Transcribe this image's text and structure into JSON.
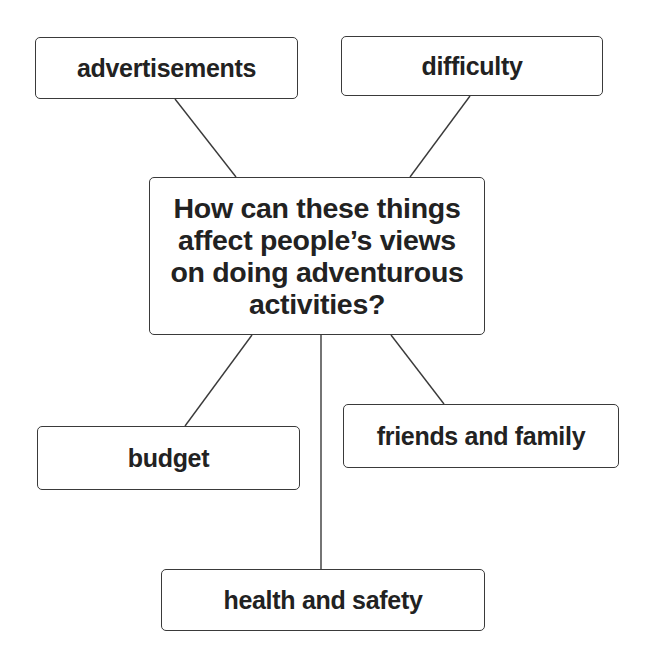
{
  "diagram": {
    "type": "mind-map",
    "center": {
      "lines": [
        "How can these things",
        "affect people’s views",
        "on doing adventurous",
        "activities?"
      ]
    },
    "nodes": [
      {
        "id": "advertisements",
        "label": "advertisements"
      },
      {
        "id": "difficulty",
        "label": "difficulty"
      },
      {
        "id": "budget",
        "label": "budget"
      },
      {
        "id": "friends-and-family",
        "label": "friends and family"
      },
      {
        "id": "health-and-safety",
        "label": "health and safety"
      }
    ],
    "colors": {
      "border": "#3a3a3a",
      "text": "#222222",
      "background": "#ffffff"
    }
  }
}
